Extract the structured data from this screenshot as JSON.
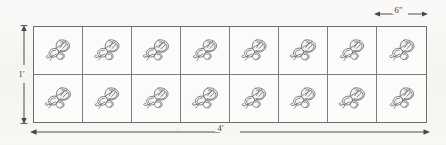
{
  "diagram": {
    "background_color": "#f7f6f3",
    "line_color": "#6d6f72",
    "tile_fill_color": "#fcfbfa",
    "motif_color": "#5c5e61",
    "grid": {
      "columns": 8,
      "rows": 2,
      "total_tiles": 16,
      "tile_motif": "leaf-sprig-icon"
    },
    "dimensions": [
      {
        "name": "tile-width",
        "label": "6\"",
        "position": "top-right",
        "spans": "one tile column"
      },
      {
        "name": "rectangle-height",
        "label": "1'",
        "position": "left",
        "spans": "full height"
      },
      {
        "name": "rectangle-width",
        "label": "4'",
        "position": "bottom",
        "spans": "full width"
      }
    ]
  }
}
